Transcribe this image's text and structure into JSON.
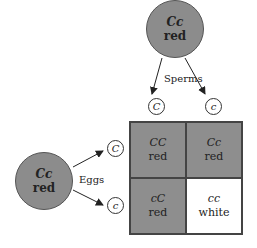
{
  "male_parent": {
    "genotype": "Cc",
    "phenotype": "red"
  },
  "female_parent": {
    "genotype": "Cc",
    "phenotype": "red"
  },
  "labels": {
    "sperms": "Sperms",
    "eggs": "Eggs"
  },
  "sperm_gametes": [
    "C",
    "c"
  ],
  "egg_gametes": [
    "C",
    "c"
  ],
  "punnett": [
    [
      {
        "genotype": "CC",
        "phenotype": "red"
      },
      {
        "genotype": "Cc",
        "phenotype": "red"
      }
    ],
    [
      {
        "genotype": "cC",
        "phenotype": "red"
      },
      {
        "genotype": "cc",
        "phenotype": "white"
      }
    ]
  ],
  "colors": {
    "red_fill": "#8e8e8e",
    "white_fill": "#ffffff"
  }
}
